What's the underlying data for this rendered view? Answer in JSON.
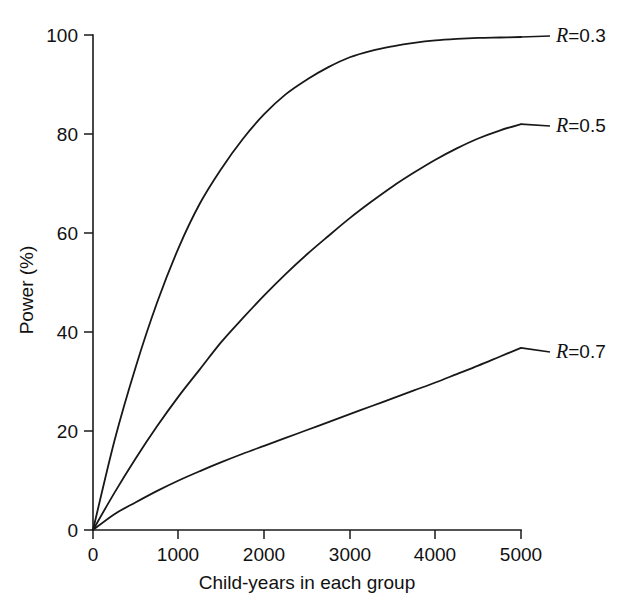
{
  "figure": {
    "ghost_caption_above": "",
    "background_color": "#ffffff",
    "ink_color": "#181818"
  },
  "axes": {
    "y": {
      "title": "Power (%)",
      "ticks": [
        "0",
        "20",
        "40",
        "60",
        "80",
        "100"
      ],
      "min": 0,
      "max": 100
    },
    "x": {
      "title": "Child-years in each group",
      "ticks": [
        "0",
        "1000",
        "2000",
        "3000",
        "4000",
        "5000"
      ],
      "min": 0,
      "max": 5000
    }
  },
  "series_labels": [
    {
      "var": "R",
      "value": "=0.3"
    },
    {
      "var": "R",
      "value": "=0.5"
    },
    {
      "var": "R",
      "value": "=0.7"
    }
  ],
  "chart_data": {
    "type": "line",
    "title": "",
    "subtitle": "",
    "xlabel": "Child-years in each group",
    "ylabel": "Power (%)",
    "xlim": [
      0,
      5000
    ],
    "ylim": [
      0,
      100
    ],
    "xticks": [
      0,
      1000,
      2000,
      3000,
      4000,
      5000
    ],
    "yticks": [
      0,
      20,
      40,
      60,
      80,
      100
    ],
    "grid": false,
    "legend_position": "right-inline-annotations",
    "x": [
      0,
      250,
      500,
      750,
      1000,
      1250,
      1500,
      1750,
      2000,
      2250,
      2500,
      2750,
      3000,
      3250,
      3500,
      3750,
      4000,
      4250,
      4500,
      4750,
      5000
    ],
    "series": [
      {
        "name": "R=0.3",
        "annotation": "R=0.3",
        "values": [
          0,
          18,
          33,
          46,
          57,
          66,
          73,
          79,
          84,
          88,
          91,
          93.5,
          95.5,
          96.8,
          97.7,
          98.4,
          98.9,
          99.2,
          99.4,
          99.5,
          99.6
        ]
      },
      {
        "name": "R=0.5",
        "annotation": "R=0.5",
        "values": [
          0,
          7.5,
          14.5,
          21,
          27,
          32.5,
          38,
          42.8,
          47.4,
          51.7,
          55.7,
          59.4,
          63,
          66.3,
          69.4,
          72.2,
          74.8,
          77.1,
          79.1,
          80.7,
          82
        ]
      },
      {
        "name": "R=0.7",
        "annotation": "R=0.7",
        "values": [
          0,
          3.2,
          5.6,
          7.9,
          10,
          11.9,
          13.7,
          15.4,
          17,
          18.6,
          20.2,
          21.8,
          23.4,
          25,
          26.6,
          28.2,
          29.8,
          31.5,
          33.2,
          35,
          36.8
        ]
      }
    ],
    "annotation_anchor_points": [
      {
        "label": "R=0.3",
        "x": 5000,
        "y": 99.6
      },
      {
        "label": "R=0.5",
        "x": 5000,
        "y": 82
      },
      {
        "label": "R=0.7",
        "x": 5000,
        "y": 36.8
      }
    ]
  }
}
